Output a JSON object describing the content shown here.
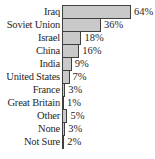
{
  "chart_data": {
    "type": "bar",
    "orientation": "horizontal",
    "title": "",
    "xlabel": "",
    "ylabel": "",
    "unit": "%",
    "xlim": [
      0,
      64
    ],
    "grid": false,
    "legend": null,
    "categories": [
      "Iraq",
      "Soviet Union",
      "Israel",
      "China",
      "India",
      "United States",
      "France",
      "Great Britain",
      "Other",
      "None",
      "Not Sure"
    ],
    "values": [
      64,
      36,
      18,
      16,
      9,
      7,
      3,
      1,
      5,
      3,
      2
    ],
    "value_labels": [
      "64%",
      "36%",
      "18%",
      "16%",
      "9%",
      "7%",
      "3%",
      "1%",
      "5%",
      "3%",
      "2%"
    ],
    "bar_fill_color": "#c9c9c9",
    "bar_border_color": "#3f3f3f",
    "text_color": "#1f1f1f",
    "background_color": "#ffffff"
  }
}
